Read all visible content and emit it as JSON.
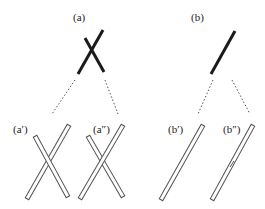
{
  "diagram": {
    "labels": {
      "a": "(a)",
      "b": "(b)",
      "a_prime": "(a′)",
      "a_double_prime": "(a″)",
      "b_prime": "(b′)",
      "b_double_prime": "(b″)"
    },
    "colors": {
      "stroke": "#1a1a1a",
      "dotted": "#555555",
      "rod_outline": "#555555",
      "rod_fill": "#ffffff"
    }
  }
}
